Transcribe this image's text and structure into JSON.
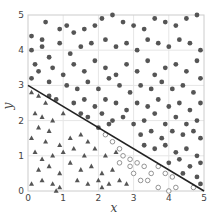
{
  "chart_data": {
    "type": "scatter",
    "title": "",
    "xlabel": "x",
    "ylabel": "y",
    "xlim": [
      0,
      5
    ],
    "ylim": [
      0,
      5
    ],
    "xticks": [
      "0",
      "1",
      "2",
      "3",
      "4",
      "5"
    ],
    "yticks": [
      "0",
      "1",
      "2",
      "3",
      "4",
      "5"
    ],
    "grid": true,
    "legend": null,
    "decision_line": {
      "x": [
        0,
        5
      ],
      "y": [
        3,
        0
      ],
      "color": "#222222"
    },
    "series": [
      {
        "name": "filled-circles",
        "marker": "circle-filled",
        "color": "#555555",
        "points": [
          [
            0.1,
            4.4
          ],
          [
            0.4,
            4.3
          ],
          [
            0.5,
            4.8
          ],
          [
            0.9,
            4.6
          ],
          [
            1.1,
            4.7
          ],
          [
            1.3,
            4.5
          ],
          [
            1.6,
            4.6
          ],
          [
            1.9,
            4.7
          ],
          [
            2.1,
            4.9
          ],
          [
            2.4,
            5.0
          ],
          [
            2.7,
            4.8
          ],
          [
            3.0,
            4.7
          ],
          [
            3.3,
            4.6
          ],
          [
            3.6,
            4.9
          ],
          [
            3.9,
            4.8
          ],
          [
            4.2,
            4.7
          ],
          [
            4.5,
            4.9
          ],
          [
            4.8,
            5.0
          ],
          [
            0.1,
            4.0
          ],
          [
            0.4,
            4.1
          ],
          [
            0.6,
            3.8
          ],
          [
            0.9,
            4.2
          ],
          [
            1.2,
            3.9
          ],
          [
            1.5,
            4.1
          ],
          [
            1.8,
            4.2
          ],
          [
            2.2,
            4.3
          ],
          [
            2.5,
            4.1
          ],
          [
            2.8,
            4.2
          ],
          [
            3.1,
            4.0
          ],
          [
            3.4,
            4.3
          ],
          [
            3.7,
            4.2
          ],
          [
            4.0,
            4.1
          ],
          [
            4.3,
            4.3
          ],
          [
            4.6,
            4.2
          ],
          [
            4.9,
            4.0
          ],
          [
            0.2,
            3.6
          ],
          [
            0.3,
            3.4
          ],
          [
            0.7,
            3.5
          ],
          [
            1.0,
            3.3
          ],
          [
            1.3,
            3.6
          ],
          [
            1.6,
            3.4
          ],
          [
            1.9,
            3.7
          ],
          [
            2.2,
            3.5
          ],
          [
            2.5,
            3.3
          ],
          [
            2.8,
            3.6
          ],
          [
            3.1,
            3.4
          ],
          [
            3.4,
            3.7
          ],
          [
            3.6,
            3.3
          ],
          [
            3.9,
            3.5
          ],
          [
            4.2,
            3.6
          ],
          [
            4.5,
            3.4
          ],
          [
            4.8,
            3.7
          ],
          [
            0.1,
            3.2
          ],
          [
            0.6,
            3.1
          ],
          [
            1.1,
            3.0
          ],
          [
            1.4,
            2.9
          ],
          [
            1.7,
            3.1
          ],
          [
            2.0,
            2.9
          ],
          [
            2.3,
            3.2
          ],
          [
            2.6,
            3.0
          ],
          [
            2.9,
            2.8
          ],
          [
            3.2,
            3.0
          ],
          [
            3.5,
            2.9
          ],
          [
            3.8,
            3.1
          ],
          [
            4.1,
            2.9
          ],
          [
            4.4,
            3.0
          ],
          [
            4.7,
            2.8
          ],
          [
            4.9,
            3.2
          ],
          [
            0.6,
            2.7
          ],
          [
            0.8,
            2.6
          ],
          [
            1.3,
            2.5
          ],
          [
            1.6,
            2.6
          ],
          [
            1.9,
            2.4
          ],
          [
            2.2,
            2.6
          ],
          [
            2.5,
            2.5
          ],
          [
            2.8,
            2.3
          ],
          [
            3.1,
            2.5
          ],
          [
            3.4,
            2.4
          ],
          [
            3.7,
            2.6
          ],
          [
            4.0,
            2.4
          ],
          [
            4.3,
            2.5
          ],
          [
            4.6,
            2.3
          ],
          [
            4.9,
            2.5
          ],
          [
            1.5,
            2.2
          ],
          [
            1.7,
            2.1
          ],
          [
            2.1,
            2.2
          ],
          [
            2.4,
            2.0
          ],
          [
            2.7,
            2.1
          ],
          [
            3.0,
            1.9
          ],
          [
            3.3,
            2.0
          ],
          [
            3.6,
            2.2
          ],
          [
            3.9,
            1.9
          ],
          [
            4.2,
            2.1
          ],
          [
            4.5,
            1.9
          ],
          [
            4.8,
            2.0
          ],
          [
            2.0,
            1.8
          ],
          [
            2.3,
            1.9
          ],
          [
            3.2,
            1.6
          ],
          [
            3.5,
            1.7
          ],
          [
            3.8,
            1.5
          ],
          [
            4.1,
            1.7
          ],
          [
            4.4,
            1.6
          ],
          [
            4.7,
            1.7
          ],
          [
            4.9,
            1.5
          ],
          [
            3.3,
            1.3
          ],
          [
            3.6,
            1.2
          ],
          [
            3.9,
            1.3
          ],
          [
            4.2,
            1.1
          ],
          [
            4.5,
            1.2
          ],
          [
            4.8,
            1.0
          ],
          [
            4.0,
            0.8
          ],
          [
            4.3,
            0.9
          ],
          [
            4.6,
            0.7
          ],
          [
            4.9,
            0.8
          ],
          [
            4.4,
            0.5
          ],
          [
            4.8,
            0.4
          ],
          [
            4.9,
            0.2
          ]
        ]
      },
      {
        "name": "triangles",
        "marker": "triangle-filled",
        "color": "#555555",
        "points": [
          [
            0.1,
            2.8
          ],
          [
            0.3,
            2.7
          ],
          [
            0.5,
            2.5
          ],
          [
            0.2,
            2.2
          ],
          [
            0.4,
            2.1
          ],
          [
            0.7,
            2.0
          ],
          [
            1.0,
            2.2
          ],
          [
            0.3,
            1.8
          ],
          [
            0.6,
            1.7
          ],
          [
            0.1,
            1.5
          ],
          [
            0.5,
            1.4
          ],
          [
            0.9,
            1.3
          ],
          [
            1.2,
            1.5
          ],
          [
            1.5,
            1.6
          ],
          [
            1.7,
            1.4
          ],
          [
            0.2,
            1.1
          ],
          [
            0.4,
            0.9
          ],
          [
            0.7,
            1.0
          ],
          [
            1.0,
            1.1
          ],
          [
            1.3,
            1.2
          ],
          [
            1.6,
            1.0
          ],
          [
            1.9,
            1.2
          ],
          [
            2.2,
            1.0
          ],
          [
            2.5,
            1.1
          ],
          [
            0.3,
            0.6
          ],
          [
            0.6,
            0.7
          ],
          [
            0.9,
            0.5
          ],
          [
            1.2,
            0.8
          ],
          [
            1.5,
            0.6
          ],
          [
            1.8,
            0.7
          ],
          [
            2.1,
            0.5
          ],
          [
            2.4,
            0.6
          ],
          [
            0.1,
            0.2
          ],
          [
            0.4,
            0.3
          ],
          [
            0.7,
            0.2
          ],
          [
            0.9,
            0.1
          ],
          [
            1.4,
            0.3
          ],
          [
            1.7,
            0.2
          ],
          [
            2.0,
            0.3
          ],
          [
            2.3,
            0.2
          ],
          [
            2.6,
            0.3
          ],
          [
            2.8,
            0.2
          ],
          [
            0.8,
            0.0
          ],
          [
            2.1,
            0.1
          ]
        ]
      },
      {
        "name": "open-circles",
        "marker": "circle-open",
        "color": "#888888",
        "points": [
          [
            2.2,
            1.6
          ],
          [
            2.4,
            1.4
          ],
          [
            2.6,
            1.2
          ],
          [
            2.7,
            1.0
          ],
          [
            2.9,
            0.9
          ],
          [
            2.6,
            0.8
          ],
          [
            2.9,
            0.7
          ],
          [
            3.1,
            0.8
          ],
          [
            3.3,
            0.7
          ],
          [
            3.0,
            0.5
          ],
          [
            3.2,
            0.3
          ],
          [
            3.4,
            0.3
          ],
          [
            3.5,
            0.5
          ],
          [
            3.7,
            0.7
          ],
          [
            3.9,
            0.5
          ],
          [
            4.1,
            0.4
          ],
          [
            3.7,
            0.1
          ],
          [
            4.0,
            0.0
          ],
          [
            4.2,
            0.1
          ],
          [
            4.7,
            0.1
          ]
        ]
      }
    ]
  }
}
